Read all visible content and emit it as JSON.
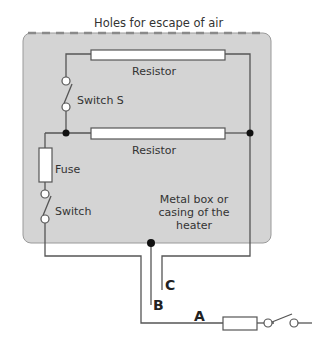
{
  "title": "Holes for escape of air",
  "labels": {
    "resistor_top": "Resistor",
    "resistor_bottom": "Resistor",
    "switch_s": "Switch S",
    "fuse": "Fuse",
    "switch": "Switch",
    "casing_line1": "Metal box or",
    "casing_line2": "casing of the",
    "casing_line3": "heater",
    "wire_a": "A",
    "wire_b": "B",
    "wire_c": "C"
  },
  "colors": {
    "casing_fill": "#d4d4d4",
    "wire": "#555555",
    "component_fill": "#ffffff"
  }
}
